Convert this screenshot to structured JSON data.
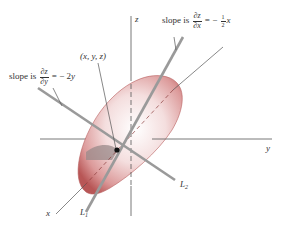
{
  "figure": {
    "colors": {
      "surface": "#c86a6a",
      "surface_highlight": "#f6e6e6",
      "axis": "#555555",
      "tangent_line": "#9a9a9a",
      "point": "#111111"
    },
    "axes": {
      "z_label": "z",
      "y_label": "y",
      "x_label": "x"
    },
    "lines": {
      "L1_label": "L",
      "L1_sub": "1",
      "L2_label": "L",
      "L2_sub": "2"
    },
    "point_label": "(x, y, z)",
    "annotations": {
      "slope_y": {
        "prefix": "slope is",
        "num": "∂z",
        "den": "∂y",
        "rhs": "= − 2",
        "var": "y"
      },
      "slope_x": {
        "prefix": "slope is",
        "num": "∂z",
        "den": "∂x",
        "rhs": "= −",
        "frac_num": "1",
        "frac_den": "2",
        "var": "x"
      }
    }
  }
}
